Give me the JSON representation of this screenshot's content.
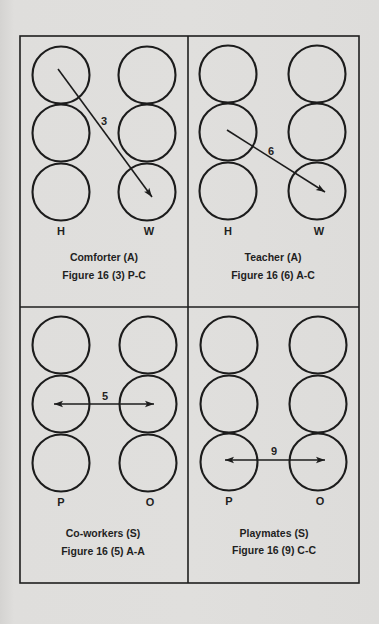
{
  "colors": {
    "background": "#dedddb",
    "ink": "#1c1c1c"
  },
  "frame": {
    "outer": {
      "x1": 20,
      "y1": 36,
      "x2": 359,
      "y2": 583
    },
    "vertical_divider_x": 188,
    "horizontal_divider_y": 307
  },
  "panels": [
    {
      "id": "comforter",
      "title": "Comforter (A)",
      "figure": "Figure 16 (3) P-C",
      "left_label": "H",
      "right_label": "W",
      "arrow_number": "3",
      "arrow_type": "single",
      "arrow_from": "left-row-1",
      "arrow_to": "right-row-3",
      "circles": {
        "left_cx": 61,
        "right_cx": 147,
        "rows_cy": [
          75,
          133,
          192
        ],
        "r": 28.5
      },
      "arrow": {
        "x1": 58,
        "y1": 69,
        "x2": 152,
        "y2": 197
      },
      "number_pos": {
        "x": 104,
        "y": 125
      },
      "col_label_y": 235,
      "title_pos": {
        "x": 104,
        "y": 261
      },
      "figure_pos": {
        "x": 104,
        "y": 279
      }
    },
    {
      "id": "teacher",
      "title": "Teacher (A)",
      "figure": "Figure 16 (6) A-C",
      "left_label": "H",
      "right_label": "W",
      "arrow_number": "6",
      "arrow_type": "single",
      "arrow_from": "left-row-2",
      "arrow_to": "right-row-3",
      "circles": {
        "left_cx": 228,
        "right_cx": 317,
        "rows_cy": [
          74,
          132,
          191
        ],
        "r": 28.5
      },
      "arrow": {
        "x1": 227,
        "y1": 130,
        "x2": 325,
        "y2": 192
      },
      "number_pos": {
        "x": 271,
        "y": 155
      },
      "col_label_y": 235,
      "title_pos": {
        "x": 273,
        "y": 261
      },
      "figure_pos": {
        "x": 273,
        "y": 279
      }
    },
    {
      "id": "co-workers",
      "title": "Co-workers (S)",
      "figure": "Figure 16 (5) A-A",
      "left_label": "P",
      "right_label": "O",
      "arrow_number": "5",
      "arrow_type": "double",
      "arrow_from": "left-row-2",
      "arrow_to": "right-row-2",
      "circles": {
        "left_cx": 61,
        "right_cx": 148,
        "rows_cy": [
          345,
          404,
          463
        ],
        "r": 28.5
      },
      "arrow": {
        "x1": 54,
        "y1": 404,
        "x2": 154,
        "y2": 404
      },
      "number_pos": {
        "x": 105,
        "y": 400
      },
      "col_label_y": 506,
      "title_pos": {
        "x": 103,
        "y": 537
      },
      "figure_pos": {
        "x": 103,
        "y": 555
      }
    },
    {
      "id": "playmates",
      "title": "Playmates (S)",
      "figure": "Figure 16 (9) C-C",
      "left_label": "P",
      "right_label": "O",
      "arrow_number": "9",
      "arrow_type": "double",
      "arrow_from": "left-row-3",
      "arrow_to": "right-row-3",
      "circles": {
        "left_cx": 229,
        "right_cx": 318,
        "rows_cy": [
          345,
          404,
          462
        ],
        "r": 28.5
      },
      "arrow": {
        "x1": 225,
        "y1": 460,
        "x2": 325,
        "y2": 460
      },
      "number_pos": {
        "x": 274,
        "y": 455
      },
      "col_label_y": 505,
      "title_pos": {
        "x": 274,
        "y": 537
      },
      "figure_pos": {
        "x": 274,
        "y": 554
      }
    }
  ]
}
